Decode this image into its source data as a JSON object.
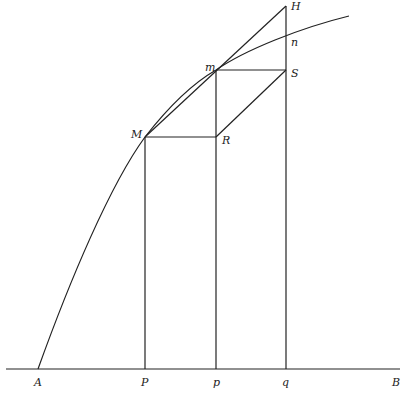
{
  "diagram": {
    "colors": {
      "ink": "#222222",
      "background": "#ffffff"
    },
    "points": {
      "A": {
        "label": "A",
        "x": 38,
        "y": 369
      },
      "P": {
        "label": "P",
        "x": 145,
        "y": 369
      },
      "p": {
        "label": "p",
        "x": 216,
        "y": 369
      },
      "q": {
        "label": "q",
        "x": 286,
        "y": 369
      },
      "B": {
        "label": "B",
        "x": 400,
        "y": 369
      },
      "M": {
        "label": "M",
        "x": 145,
        "y": 137
      },
      "R": {
        "label": "R",
        "x": 216,
        "y": 137
      },
      "m": {
        "label": "m",
        "x": 216,
        "y": 70
      },
      "S": {
        "label": "S",
        "x": 286,
        "y": 70
      },
      "n": {
        "label": "n",
        "x": 286,
        "y": 36
      },
      "H": {
        "label": "H",
        "x": 286,
        "y": 6
      }
    },
    "labels": [
      "A",
      "P",
      "p",
      "q",
      "B",
      "M",
      "R",
      "m",
      "S",
      "n",
      "H"
    ]
  }
}
